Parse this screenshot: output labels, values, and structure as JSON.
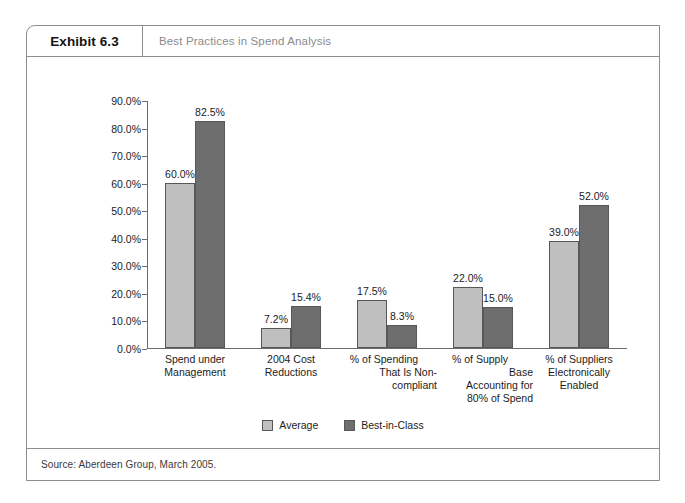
{
  "exhibit": {
    "number_label": "Exhibit 6.3",
    "title": "Best Practices in Spend Analysis",
    "source": "Source: Aberdeen Group, March 2005."
  },
  "colors": {
    "average": "#bfbfbf",
    "best_in_class": "#6e6e6e",
    "frame": "#8d8d8d",
    "axis": "#6d6d6d",
    "title_text": "#8b8b8b"
  },
  "chart_data": {
    "type": "bar",
    "title": "Best Practices in Spend Analysis",
    "subtitle": "",
    "xlabel": "",
    "ylabel": "",
    "ylim": [
      0,
      90
    ],
    "grid": false,
    "legend_position": "bottom-center",
    "y_ticks": [
      "0.0%",
      "10.0%",
      "20.0%",
      "30.0%",
      "40.0%",
      "50.0%",
      "60.0%",
      "70.0%",
      "80.0%",
      "90.0%"
    ],
    "y_tick_values": [
      0,
      10,
      20,
      30,
      40,
      50,
      60,
      70,
      80,
      90
    ],
    "categories": [
      "Spend under Management",
      "2004 Cost Reductions",
      "% of Spending That Is Non-compliant",
      "% of Supply Base Accounting for 80% of Spend",
      "% of Suppliers Electronically Enabled"
    ],
    "category_lines": [
      [
        "Spend under",
        "Management"
      ],
      [
        "2004 Cost",
        "Reductions"
      ],
      [
        "% of Spending",
        "That Is Non-",
        "compliant"
      ],
      [
        "% of Supply",
        "Base",
        "Accounting for",
        "80% of Spend"
      ],
      [
        "% of Suppliers",
        "Electronically",
        "Enabled"
      ]
    ],
    "series": [
      {
        "name": "Average",
        "color": "#bfbfbf",
        "values": [
          60.0,
          7.2,
          17.5,
          22.0,
          39.0
        ],
        "labels": [
          "60.0%",
          "7.2%",
          "17.5%",
          "22.0%",
          "39.0%"
        ]
      },
      {
        "name": "Best-in-Class",
        "color": "#6e6e6e",
        "values": [
          82.5,
          15.4,
          8.3,
          15.0,
          52.0
        ],
        "labels": [
          "82.5%",
          "15.4%",
          "8.3%",
          "15.0%",
          "52.0%"
        ]
      }
    ]
  },
  "legend": {
    "items": [
      {
        "label": "Average",
        "swatch": "average"
      },
      {
        "label": "Best-in-Class",
        "swatch": "best_in_class"
      }
    ]
  }
}
